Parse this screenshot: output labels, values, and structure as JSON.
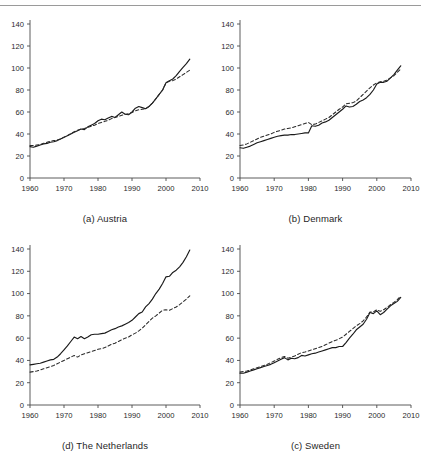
{
  "figure": {
    "panel_captions": [
      "(a) Austria",
      "(b) Denmark",
      "(d) The Netherlands",
      "(c) Sweden"
    ],
    "rule_color": "#9a9a9a"
  },
  "axis": {
    "y_ticks": [
      "0",
      "20",
      "40",
      "60",
      "80",
      "100",
      "120",
      "140"
    ],
    "x_ticks": [
      "1960",
      "1970",
      "1980",
      "1990",
      "2000",
      "2010"
    ]
  },
  "chart_data": [
    {
      "type": "line",
      "title": "(a) Austria",
      "xlabel": "",
      "ylabel": "",
      "xlim": [
        1960,
        2010
      ],
      "ylim": [
        0,
        140
      ],
      "xticks": [
        1960,
        1970,
        1980,
        1990,
        2000,
        2010
      ],
      "yticks": [
        0,
        20,
        40,
        60,
        80,
        100,
        120,
        140
      ],
      "grid": false,
      "legend": "none",
      "series": [
        {
          "name": "solid",
          "style": "solid",
          "color": "#1a1a1a",
          "x": [
            1960,
            1961,
            1962,
            1963,
            1964,
            1965,
            1966,
            1967,
            1968,
            1969,
            1970,
            1971,
            1972,
            1973,
            1974,
            1975,
            1976,
            1977,
            1978,
            1979,
            1980,
            1981,
            1982,
            1983,
            1984,
            1985,
            1986,
            1987,
            1988,
            1989,
            1990,
            1991,
            1992,
            1993,
            1994,
            1995,
            1996,
            1997,
            1998,
            1999,
            2000,
            2001,
            2002,
            2003,
            2004,
            2005,
            2006,
            2007
          ],
          "values": [
            28.5,
            28.0,
            29.0,
            30.0,
            31.0,
            31.5,
            32.5,
            33.0,
            34.0,
            35.5,
            37.0,
            38.5,
            40.0,
            41.5,
            43.0,
            44.5,
            44.0,
            46.5,
            48.0,
            49.5,
            52.0,
            53.5,
            53.0,
            54.5,
            56.0,
            55.0,
            57.5,
            60.0,
            58.0,
            57.5,
            60.0,
            63.5,
            65.0,
            64.0,
            63.0,
            65.0,
            68.0,
            72.0,
            76.0,
            80.0,
            86.5,
            88.5,
            90.0,
            93.0,
            97.0,
            100.5,
            104.0,
            108.0
          ]
        },
        {
          "name": "dashed",
          "style": "dashed",
          "color": "#2a2a2a",
          "x": [
            1960,
            1961,
            1962,
            1963,
            1964,
            1965,
            1966,
            1967,
            1968,
            1969,
            1970,
            1971,
            1972,
            1973,
            1974,
            1975,
            1976,
            1977,
            1978,
            1979,
            1980,
            1981,
            1982,
            1983,
            1984,
            1985,
            1986,
            1987,
            1988,
            1989,
            1990,
            1991,
            1992,
            1993,
            1994,
            1995,
            1996,
            1997,
            1998,
            1999,
            2000,
            2001,
            2002,
            2003,
            2004,
            2005,
            2006,
            2007
          ],
          "values": [
            29.5,
            29.5,
            30.0,
            30.5,
            31.5,
            32.5,
            33.5,
            34.0,
            34.5,
            35.5,
            37.0,
            38.5,
            40.5,
            42.0,
            43.5,
            44.5,
            45.0,
            46.0,
            47.0,
            48.0,
            49.5,
            50.5,
            51.5,
            52.5,
            54.0,
            55.0,
            56.0,
            57.0,
            58.0,
            58.5,
            59.5,
            61.0,
            62.0,
            62.5,
            63.0,
            65.0,
            68.0,
            72.0,
            76.0,
            80.0,
            86.5,
            88.0,
            88.5,
            90.0,
            92.0,
            94.0,
            96.0,
            98.0
          ]
        }
      ]
    },
    {
      "type": "line",
      "title": "(b) Denmark",
      "xlabel": "",
      "ylabel": "",
      "xlim": [
        1960,
        2010
      ],
      "ylim": [
        0,
        140
      ],
      "xticks": [
        1960,
        1970,
        1980,
        1990,
        2000,
        2010
      ],
      "yticks": [
        0,
        20,
        40,
        60,
        80,
        100,
        120,
        140
      ],
      "grid": false,
      "legend": "none",
      "series": [
        {
          "name": "solid",
          "style": "solid",
          "color": "#1a1a1a",
          "x": [
            1960,
            1961,
            1962,
            1963,
            1964,
            1965,
            1966,
            1967,
            1968,
            1969,
            1970,
            1971,
            1972,
            1973,
            1974,
            1975,
            1976,
            1977,
            1978,
            1979,
            1980,
            1981,
            1982,
            1983,
            1984,
            1985,
            1986,
            1987,
            1988,
            1989,
            1990,
            1991,
            1992,
            1993,
            1994,
            1995,
            1996,
            1997,
            1998,
            1999,
            2000,
            2001,
            2002,
            2003,
            2004,
            2005,
            2006,
            2007
          ],
          "values": [
            27.5,
            27.0,
            28.0,
            29.0,
            30.5,
            32.0,
            33.0,
            34.0,
            35.0,
            36.0,
            37.0,
            38.0,
            38.5,
            39.0,
            39.0,
            39.5,
            39.5,
            40.0,
            40.5,
            41.0,
            41.0,
            47.5,
            47.0,
            48.0,
            50.0,
            51.0,
            52.5,
            55.0,
            57.5,
            60.0,
            62.5,
            65.5,
            64.5,
            65.0,
            67.0,
            69.5,
            71.0,
            73.0,
            76.0,
            80.0,
            85.5,
            87.0,
            87.0,
            88.0,
            91.0,
            94.0,
            98.0,
            102.0
          ]
        },
        {
          "name": "dashed",
          "style": "dashed",
          "color": "#2a2a2a",
          "x": [
            1960,
            1961,
            1962,
            1963,
            1964,
            1965,
            1966,
            1967,
            1968,
            1969,
            1970,
            1971,
            1972,
            1973,
            1974,
            1975,
            1976,
            1977,
            1978,
            1979,
            1980,
            1981,
            1982,
            1983,
            1984,
            1985,
            1986,
            1987,
            1988,
            1989,
            1990,
            1991,
            1992,
            1993,
            1994,
            1995,
            1996,
            1997,
            1998,
            1999,
            2000,
            2001,
            2002,
            2003,
            2004,
            2005,
            2006,
            2007
          ],
          "values": [
            29.5,
            30.0,
            31.0,
            32.5,
            34.0,
            35.5,
            37.0,
            38.0,
            39.0,
            40.0,
            41.5,
            42.5,
            43.5,
            44.5,
            45.0,
            45.5,
            46.5,
            47.5,
            48.5,
            49.5,
            50.5,
            48.5,
            49.0,
            50.5,
            52.0,
            53.5,
            55.0,
            57.5,
            60.0,
            62.5,
            64.5,
            67.5,
            68.0,
            68.5,
            70.0,
            73.0,
            76.0,
            79.0,
            82.0,
            84.5,
            86.5,
            87.5,
            88.0,
            89.0,
            91.0,
            93.0,
            96.0,
            99.0
          ]
        }
      ]
    },
    {
      "type": "line",
      "title": "(d) The Netherlands",
      "xlabel": "",
      "ylabel": "",
      "xlim": [
        1960,
        2010
      ],
      "ylim": [
        0,
        140
      ],
      "xticks": [
        1960,
        1970,
        1980,
        1990,
        2000,
        2010
      ],
      "yticks": [
        0,
        20,
        40,
        60,
        80,
        100,
        120,
        140
      ],
      "grid": false,
      "legend": "none",
      "series": [
        {
          "name": "solid",
          "style": "solid",
          "color": "#1a1a1a",
          "x": [
            1960,
            1961,
            1962,
            1963,
            1964,
            1965,
            1966,
            1967,
            1968,
            1969,
            1970,
            1971,
            1972,
            1973,
            1974,
            1975,
            1976,
            1977,
            1978,
            1979,
            1980,
            1981,
            1982,
            1983,
            1984,
            1985,
            1986,
            1987,
            1988,
            1989,
            1990,
            1991,
            1992,
            1993,
            1994,
            1995,
            1996,
            1997,
            1998,
            1999,
            2000,
            2001,
            2002,
            2003,
            2004,
            2005,
            2006,
            2007
          ],
          "values": [
            36.0,
            36.5,
            37.0,
            37.5,
            38.5,
            39.5,
            40.5,
            41.0,
            43.0,
            46.0,
            49.5,
            53.0,
            57.0,
            61.0,
            59.5,
            61.5,
            59.5,
            61.0,
            63.0,
            63.5,
            63.5,
            64.0,
            64.5,
            66.0,
            67.5,
            68.5,
            70.0,
            71.0,
            72.5,
            74.0,
            76.0,
            79.0,
            82.0,
            83.5,
            88.0,
            91.0,
            95.0,
            100.0,
            104.0,
            109.0,
            115.0,
            115.5,
            119.0,
            121.0,
            124.0,
            128.0,
            133.0,
            139.0
          ]
        },
        {
          "name": "dashed",
          "style": "dashed",
          "color": "#2a2a2a",
          "x": [
            1960,
            1961,
            1962,
            1963,
            1964,
            1965,
            1966,
            1967,
            1968,
            1969,
            1970,
            1971,
            1972,
            1973,
            1974,
            1975,
            1976,
            1977,
            1978,
            1979,
            1980,
            1981,
            1982,
            1983,
            1984,
            1985,
            1986,
            1987,
            1988,
            1989,
            1990,
            1991,
            1992,
            1993,
            1994,
            1995,
            1996,
            1997,
            1998,
            1999,
            2000,
            2001,
            2002,
            2003,
            2004,
            2005,
            2006,
            2007
          ],
          "values": [
            29.5,
            30.0,
            30.5,
            31.5,
            32.5,
            33.5,
            34.5,
            35.5,
            37.0,
            38.5,
            40.0,
            41.5,
            43.0,
            44.5,
            43.0,
            45.0,
            46.0,
            47.0,
            48.0,
            49.0,
            50.0,
            50.5,
            51.5,
            53.0,
            54.5,
            55.5,
            57.0,
            58.5,
            60.0,
            61.0,
            63.0,
            64.5,
            66.5,
            69.0,
            72.0,
            75.0,
            78.0,
            80.0,
            82.5,
            85.0,
            85.5,
            85.0,
            86.5,
            88.0,
            90.0,
            92.5,
            95.0,
            98.0
          ]
        }
      ]
    },
    {
      "type": "line",
      "title": "(c) Sweden",
      "xlabel": "",
      "ylabel": "",
      "xlim": [
        1960,
        2010
      ],
      "ylim": [
        0,
        140
      ],
      "xticks": [
        1960,
        1970,
        1980,
        1990,
        2000,
        2010
      ],
      "yticks": [
        0,
        20,
        40,
        60,
        80,
        100,
        120,
        140
      ],
      "grid": false,
      "legend": "none",
      "series": [
        {
          "name": "solid",
          "style": "solid",
          "color": "#1a1a1a",
          "x": [
            1960,
            1961,
            1962,
            1963,
            1964,
            1965,
            1966,
            1967,
            1968,
            1969,
            1970,
            1971,
            1972,
            1973,
            1974,
            1975,
            1976,
            1977,
            1978,
            1979,
            1980,
            1981,
            1982,
            1983,
            1984,
            1985,
            1986,
            1987,
            1988,
            1989,
            1990,
            1991,
            1992,
            1993,
            1994,
            1995,
            1996,
            1997,
            1998,
            1999,
            2000,
            2001,
            2002,
            2003,
            2004,
            2005,
            2006,
            2007
          ],
          "values": [
            28.5,
            28.5,
            29.5,
            30.5,
            31.5,
            32.5,
            33.5,
            34.5,
            35.5,
            36.5,
            38.0,
            39.5,
            41.0,
            42.5,
            40.5,
            42.0,
            41.5,
            42.5,
            44.5,
            44.0,
            45.0,
            46.0,
            46.5,
            47.5,
            48.5,
            49.5,
            50.5,
            51.5,
            51.5,
            52.5,
            52.5,
            56.0,
            60.0,
            63.5,
            67.5,
            70.0,
            72.5,
            77.0,
            83.0,
            82.0,
            84.5,
            81.0,
            83.0,
            86.0,
            89.0,
            91.0,
            93.0,
            96.5
          ]
        },
        {
          "name": "dashed",
          "style": "dashed",
          "color": "#2a2a2a",
          "x": [
            1960,
            1961,
            1962,
            1963,
            1964,
            1965,
            1966,
            1967,
            1968,
            1969,
            1970,
            1971,
            1972,
            1973,
            1974,
            1975,
            1976,
            1977,
            1978,
            1979,
            1980,
            1981,
            1982,
            1983,
            1984,
            1985,
            1986,
            1987,
            1988,
            1989,
            1990,
            1991,
            1992,
            1993,
            1994,
            1995,
            1996,
            1997,
            1998,
            1999,
            2000,
            2001,
            2002,
            2003,
            2004,
            2005,
            2006,
            2007
          ],
          "values": [
            29.5,
            30.0,
            30.5,
            31.5,
            32.5,
            33.5,
            34.5,
            35.5,
            36.5,
            38.0,
            39.5,
            41.0,
            42.5,
            43.5,
            42.0,
            43.0,
            44.0,
            45.5,
            47.0,
            47.5,
            48.5,
            49.5,
            50.5,
            51.5,
            52.5,
            54.0,
            55.5,
            57.0,
            58.0,
            59.5,
            61.0,
            63.5,
            66.0,
            68.5,
            71.0,
            73.0,
            75.5,
            79.0,
            83.5,
            83.5,
            85.5,
            84.0,
            85.5,
            87.5,
            90.0,
            92.0,
            94.5,
            98.0
          ]
        }
      ]
    }
  ]
}
